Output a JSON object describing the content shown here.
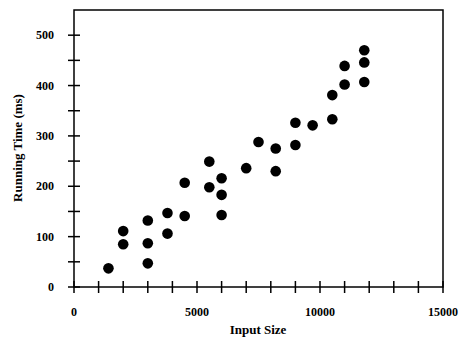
{
  "chart_data": {
    "type": "scatter",
    "title": "",
    "xlabel": "Input Size",
    "ylabel": "Running Time (ms)",
    "xlim": [
      0,
      15000
    ],
    "ylim": [
      0,
      550
    ],
    "x_ticks": [
      0,
      5000,
      10000,
      15000
    ],
    "x_tick_labels": [
      "0",
      "5000",
      "10000",
      "15000"
    ],
    "x_minor_step": 1000,
    "y_ticks": [
      0,
      100,
      200,
      300,
      400,
      500
    ],
    "y_tick_labels": [
      "0",
      "100",
      "200",
      "300",
      "400",
      "500"
    ],
    "y_minor_step": 50,
    "grid": false,
    "legend": null,
    "marker_color": "#000000",
    "series": [
      {
        "name": "measurements",
        "points": [
          {
            "x": 1400,
            "y": 37
          },
          {
            "x": 2000,
            "y": 111
          },
          {
            "x": 2000,
            "y": 85
          },
          {
            "x": 3000,
            "y": 132
          },
          {
            "x": 3000,
            "y": 87
          },
          {
            "x": 3000,
            "y": 47
          },
          {
            "x": 3800,
            "y": 147
          },
          {
            "x": 3800,
            "y": 106
          },
          {
            "x": 4500,
            "y": 207
          },
          {
            "x": 4500,
            "y": 141
          },
          {
            "x": 5500,
            "y": 249
          },
          {
            "x": 5500,
            "y": 198
          },
          {
            "x": 6000,
            "y": 216
          },
          {
            "x": 6000,
            "y": 183
          },
          {
            "x": 6000,
            "y": 143
          },
          {
            "x": 7000,
            "y": 236
          },
          {
            "x": 7500,
            "y": 288
          },
          {
            "x": 8200,
            "y": 275
          },
          {
            "x": 8200,
            "y": 230
          },
          {
            "x": 9000,
            "y": 326
          },
          {
            "x": 9000,
            "y": 282
          },
          {
            "x": 9700,
            "y": 321
          },
          {
            "x": 10500,
            "y": 333
          },
          {
            "x": 10500,
            "y": 381
          },
          {
            "x": 11000,
            "y": 439
          },
          {
            "x": 11000,
            "y": 402
          },
          {
            "x": 11800,
            "y": 470
          },
          {
            "x": 11800,
            "y": 446
          },
          {
            "x": 11800,
            "y": 407
          }
        ]
      }
    ]
  }
}
